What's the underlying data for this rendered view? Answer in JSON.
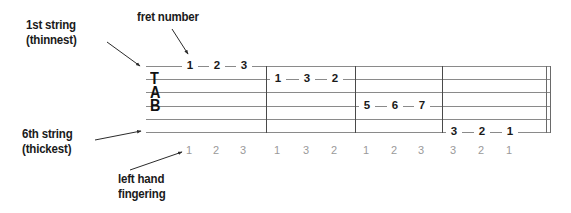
{
  "diagram": {
    "width": 571,
    "height": 213
  },
  "annotations": {
    "first_string": {
      "line1": "1st string",
      "line2": "(thinnest)"
    },
    "sixth_string": {
      "line1": "6th string",
      "line2": "(thickest)"
    },
    "fret_number": {
      "line1": "fret number"
    },
    "left_hand_fingering": {
      "line1": "left hand",
      "line2": "fingering"
    }
  },
  "tab_clef": {
    "letters": [
      "T",
      "A",
      "B"
    ]
  },
  "staff": {
    "string_count": 6,
    "line_color": "#8a8a8a",
    "barline_color": "#4a4a4a"
  },
  "measures": [
    {
      "index": 1,
      "notes": [
        {
          "fret": "1",
          "string": 1,
          "finger": "1"
        },
        {
          "fret": "2",
          "string": 1,
          "finger": "2"
        },
        {
          "fret": "3",
          "string": 1,
          "finger": "3"
        }
      ]
    },
    {
      "index": 2,
      "notes": [
        {
          "fret": "1",
          "string": 2,
          "finger": "1"
        },
        {
          "fret": "3",
          "string": 2,
          "finger": "3"
        },
        {
          "fret": "2",
          "string": 2,
          "finger": "2"
        }
      ]
    },
    {
      "index": 3,
      "notes": [
        {
          "fret": "5",
          "string": 4,
          "finger": "1"
        },
        {
          "fret": "6",
          "string": 4,
          "finger": "2"
        },
        {
          "fret": "7",
          "string": 4,
          "finger": "3"
        }
      ]
    },
    {
      "index": 4,
      "notes": [
        {
          "fret": "3",
          "string": 6,
          "finger": "3"
        },
        {
          "fret": "2",
          "string": 6,
          "finger": "2"
        },
        {
          "fret": "1",
          "string": 6,
          "finger": "1"
        }
      ]
    }
  ],
  "colors": {
    "text": "#1a1a1a",
    "staff_line": "#8a8a8a",
    "barline": "#4a4a4a",
    "fingering": "#9a9a9a",
    "background": "#ffffff"
  }
}
